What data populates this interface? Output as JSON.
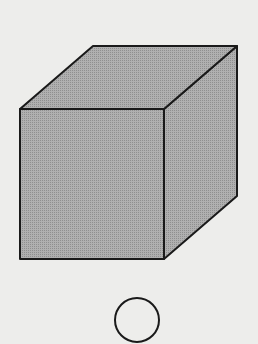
{
  "figure": {
    "background": "#ededeb",
    "stroke_color": "#1a1a1a",
    "fill_color": "#a9a9a9",
    "cube": {
      "front_face": [
        [
          20,
          109
        ],
        [
          164,
          109
        ],
        [
          164,
          259
        ],
        [
          20,
          259
        ]
      ],
      "top_face": [
        [
          20,
          109
        ],
        [
          93,
          46
        ],
        [
          237,
          46
        ],
        [
          164,
          109
        ]
      ],
      "side_face": [
        [
          164,
          109
        ],
        [
          237,
          46
        ],
        [
          237,
          196
        ],
        [
          164,
          259
        ]
      ]
    },
    "circle": {
      "cx": 137,
      "cy": 320,
      "r": 22
    }
  }
}
